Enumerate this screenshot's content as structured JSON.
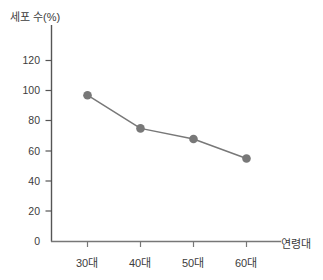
{
  "chart_data": {
    "type": "line",
    "title": "",
    "subtitle": "",
    "xlabel": "연령대",
    "ylabel": "세포 수(%)",
    "categories": [
      "30대",
      "40대",
      "50대",
      "60대"
    ],
    "values": [
      97,
      75,
      68,
      55
    ],
    "series": [
      {
        "name": "세포 수(%)",
        "values": [
          97,
          75,
          68,
          55
        ]
      }
    ],
    "ylim": [
      0,
      130
    ],
    "yticks": [
      0,
      20,
      40,
      60,
      80,
      100,
      120
    ],
    "ytick_labels": [
      "0",
      "20",
      "40",
      "60",
      "80",
      "100",
      "120"
    ],
    "xtick_labels": [
      "30대",
      "40대",
      "50대",
      "60대"
    ],
    "grid": false,
    "legend": false,
    "legend_position": "none",
    "marker": "circle",
    "series_color": "#787878",
    "axis_color": "#555555",
    "background_color": "#ffffff",
    "annotations": []
  },
  "axes": {
    "y_title": "세포 수(%)",
    "x_title": "연령대"
  }
}
